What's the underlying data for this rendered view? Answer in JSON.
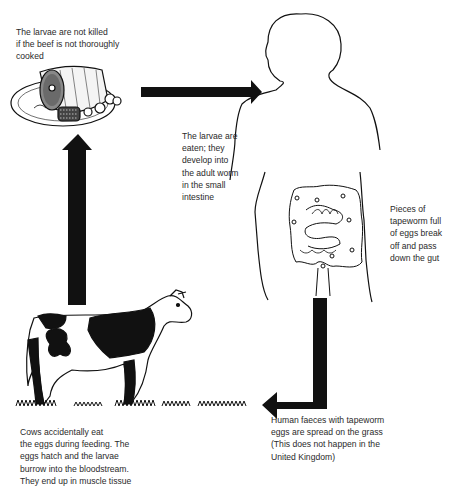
{
  "diagram": {
    "type": "life-cycle",
    "stages": [
      {
        "id": "meat",
        "icon": "roast-beef-plate-icon",
        "caption": "The larvae are not killed\nif the beef is not thoroughly\ncooked"
      },
      {
        "id": "human",
        "icon": "human-silhouette-icon",
        "caption": "The larvae are\neaten; they\ndevelop into\nthe adult worm\nin the small\nintestine"
      },
      {
        "id": "gut",
        "icon": "intestine-icon",
        "caption": "Pieces of\ntapeworm full\nof eggs break\noff and pass\ndown the gut"
      },
      {
        "id": "grass",
        "icon": "grass-icon",
        "caption": "Human faeces with tapeworm\neggs are spread on the grass\n(This does not happen in the\nUnited Kingdom)"
      },
      {
        "id": "cow",
        "icon": "cow-icon",
        "caption": "Cows accidentally eat\nthe eggs during feeding. The\neggs hatch and the larvae\nburrow into the bloodstream.\nThey end up in muscle tissue"
      }
    ],
    "arrows": [
      {
        "from": "meat",
        "to": "human",
        "direction": "right"
      },
      {
        "from": "human",
        "to": "grass",
        "direction": "down-left"
      },
      {
        "from": "cow",
        "to": "meat",
        "direction": "up"
      }
    ],
    "colors": {
      "ink": "#111111",
      "background": "#ffffff"
    }
  }
}
